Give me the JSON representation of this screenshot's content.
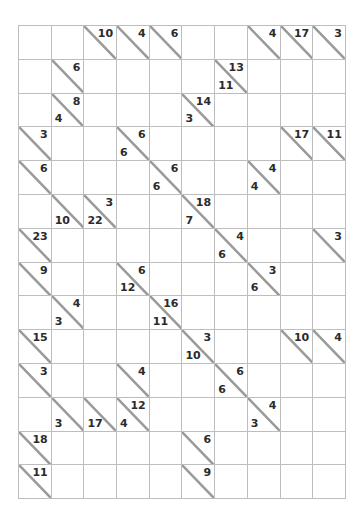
{
  "puzzle": {
    "type": "kakuro",
    "rows": 14,
    "cols": 10,
    "colors": {
      "blocked": "#a9a9a9",
      "clue_cell": "#e9e9e9",
      "open_cell": "#ffffff",
      "grid_line": "#bdbdbd",
      "slash_line": "#9a9a9a",
      "number": "#2b2b2b",
      "page_background": "#ffffff"
    },
    "legend": {
      "down_clue_position": "upper-right",
      "across_clue_position": "lower-left"
    },
    "cells": [
      [
        {
          "kind": "blocked"
        },
        {
          "kind": "blocked"
        },
        {
          "kind": "clue",
          "down": "10",
          "across": ""
        },
        {
          "kind": "clue",
          "down": "4",
          "across": ""
        },
        {
          "kind": "clue",
          "down": "6",
          "across": ""
        },
        {
          "kind": "blocked"
        },
        {
          "kind": "blocked"
        },
        {
          "kind": "clue",
          "down": "4",
          "across": ""
        },
        {
          "kind": "clue",
          "down": "17",
          "across": ""
        },
        {
          "kind": "clue",
          "down": "3",
          "across": ""
        }
      ],
      [
        {
          "kind": "blocked"
        },
        {
          "kind": "clue",
          "down": "6",
          "across": ""
        },
        {
          "kind": "open"
        },
        {
          "kind": "open"
        },
        {
          "kind": "open"
        },
        {
          "kind": "blocked"
        },
        {
          "kind": "clue",
          "down": "13",
          "across": "11"
        },
        {
          "kind": "open"
        },
        {
          "kind": "open"
        },
        {
          "kind": "open"
        }
      ],
      [
        {
          "kind": "blocked"
        },
        {
          "kind": "clue",
          "down": "8",
          "across": "4"
        },
        {
          "kind": "open"
        },
        {
          "kind": "open"
        },
        {
          "kind": "open"
        },
        {
          "kind": "clue",
          "down": "14",
          "across": "3"
        },
        {
          "kind": "open"
        },
        {
          "kind": "open"
        },
        {
          "kind": "open"
        },
        {
          "kind": "open"
        }
      ],
      [
        {
          "kind": "clue",
          "down": "3",
          "across": ""
        },
        {
          "kind": "open"
        },
        {
          "kind": "open"
        },
        {
          "kind": "clue",
          "down": "6",
          "across": "6"
        },
        {
          "kind": "open"
        },
        {
          "kind": "open"
        },
        {
          "kind": "open"
        },
        {
          "kind": "blocked"
        },
        {
          "kind": "clue",
          "down": "17",
          "across": ""
        },
        {
          "kind": "clue",
          "down": "11",
          "across": ""
        }
      ],
      [
        {
          "kind": "clue",
          "down": "6",
          "across": ""
        },
        {
          "kind": "open"
        },
        {
          "kind": "open"
        },
        {
          "kind": "open"
        },
        {
          "kind": "clue",
          "down": "6",
          "across": "6"
        },
        {
          "kind": "open"
        },
        {
          "kind": "open"
        },
        {
          "kind": "clue",
          "down": "4",
          "across": "4"
        },
        {
          "kind": "open"
        },
        {
          "kind": "open"
        }
      ],
      [
        {
          "kind": "blocked"
        },
        {
          "kind": "clue",
          "down": "",
          "across": "10"
        },
        {
          "kind": "clue",
          "down": "3",
          "across": "22"
        },
        {
          "kind": "open"
        },
        {
          "kind": "open"
        },
        {
          "kind": "clue",
          "down": "18",
          "across": "7"
        },
        {
          "kind": "open"
        },
        {
          "kind": "open"
        },
        {
          "kind": "open"
        },
        {
          "kind": "open"
        }
      ],
      [
        {
          "kind": "clue",
          "down": "23",
          "across": ""
        },
        {
          "kind": "open"
        },
        {
          "kind": "open"
        },
        {
          "kind": "open"
        },
        {
          "kind": "open"
        },
        {
          "kind": "open"
        },
        {
          "kind": "clue",
          "down": "4",
          "across": "6"
        },
        {
          "kind": "open"
        },
        {
          "kind": "open"
        },
        {
          "kind": "clue",
          "down": "3",
          "across": ""
        }
      ],
      [
        {
          "kind": "clue",
          "down": "9",
          "across": ""
        },
        {
          "kind": "open"
        },
        {
          "kind": "open"
        },
        {
          "kind": "clue",
          "down": "6",
          "across": "12"
        },
        {
          "kind": "open"
        },
        {
          "kind": "open"
        },
        {
          "kind": "open"
        },
        {
          "kind": "clue",
          "down": "3",
          "across": "6"
        },
        {
          "kind": "open"
        },
        {
          "kind": "open"
        }
      ],
      [
        {
          "kind": "blocked"
        },
        {
          "kind": "clue",
          "down": "4",
          "across": "3"
        },
        {
          "kind": "open"
        },
        {
          "kind": "open"
        },
        {
          "kind": "clue",
          "down": "16",
          "across": "11"
        },
        {
          "kind": "open"
        },
        {
          "kind": "open"
        },
        {
          "kind": "open"
        },
        {
          "kind": "open"
        },
        {
          "kind": "open"
        }
      ],
      [
        {
          "kind": "clue",
          "down": "15",
          "across": ""
        },
        {
          "kind": "open"
        },
        {
          "kind": "open"
        },
        {
          "kind": "open"
        },
        {
          "kind": "open"
        },
        {
          "kind": "clue",
          "down": "3",
          "across": "10"
        },
        {
          "kind": "open"
        },
        {
          "kind": "open"
        },
        {
          "kind": "clue",
          "down": "10",
          "across": ""
        },
        {
          "kind": "clue",
          "down": "4",
          "across": ""
        }
      ],
      [
        {
          "kind": "clue",
          "down": "3",
          "across": ""
        },
        {
          "kind": "open"
        },
        {
          "kind": "open"
        },
        {
          "kind": "clue",
          "down": "4",
          "across": ""
        },
        {
          "kind": "open"
        },
        {
          "kind": "open"
        },
        {
          "kind": "clue",
          "down": "6",
          "across": "6"
        },
        {
          "kind": "open"
        },
        {
          "kind": "open"
        },
        {
          "kind": "open"
        }
      ],
      [
        {
          "kind": "blocked"
        },
        {
          "kind": "clue",
          "down": "",
          "across": "3"
        },
        {
          "kind": "clue",
          "down": "",
          "across": "17"
        },
        {
          "kind": "clue",
          "down": "12",
          "across": "4"
        },
        {
          "kind": "open"
        },
        {
          "kind": "open"
        },
        {
          "kind": "open"
        },
        {
          "kind": "clue",
          "down": "4",
          "across": "3"
        },
        {
          "kind": "open"
        },
        {
          "kind": "open"
        }
      ],
      [
        {
          "kind": "clue",
          "down": "18",
          "across": ""
        },
        {
          "kind": "open"
        },
        {
          "kind": "open"
        },
        {
          "kind": "open"
        },
        {
          "kind": "open"
        },
        {
          "kind": "clue",
          "down": "6",
          "across": ""
        },
        {
          "kind": "open"
        },
        {
          "kind": "open"
        },
        {
          "kind": "open"
        },
        {
          "kind": "blocked"
        }
      ],
      [
        {
          "kind": "clue",
          "down": "11",
          "across": ""
        },
        {
          "kind": "open"
        },
        {
          "kind": "open"
        },
        {
          "kind": "open"
        },
        {
          "kind": "blocked"
        },
        {
          "kind": "clue",
          "down": "9",
          "across": ""
        },
        {
          "kind": "open"
        },
        {
          "kind": "open"
        },
        {
          "kind": "open"
        },
        {
          "kind": "blocked"
        }
      ]
    ]
  }
}
